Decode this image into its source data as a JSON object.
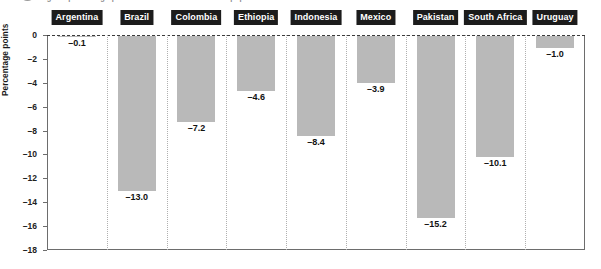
{
  "caption": {
    "bullet_icon": "bullet-dot-icon",
    "text": "Figure: percentage-point decline in the share of the population..."
  },
  "chart_data": {
    "type": "bar",
    "title": "",
    "xlabel": "",
    "ylabel": "Percentage points",
    "ylim": [
      -18,
      0
    ],
    "yticks": [
      0,
      -2,
      -4,
      -6,
      -8,
      -10,
      -12,
      -14,
      -16,
      -18
    ],
    "ytick_labels": [
      "0",
      "–2",
      "–4",
      "–6",
      "–8",
      "–10",
      "–12",
      "–14",
      "–16",
      "–18"
    ],
    "grid": "dotted-vertical-category-separators",
    "legend": "none",
    "categories": [
      "Argentina",
      "Brazil",
      "Colombia",
      "Ethiopia",
      "Indonesia",
      "Mexico",
      "Pakistan",
      "South Africa",
      "Uruguay"
    ],
    "values": [
      -0.1,
      -13.0,
      -7.2,
      -4.6,
      -8.4,
      -3.9,
      -15.2,
      -10.1,
      -1.0
    ],
    "data_labels": [
      "–0.1",
      "–13.0",
      "–7.2",
      "–4.6",
      "–8.4",
      "–3.9",
      "–15.2",
      "–10.1",
      "–1.0"
    ],
    "bar_color": "#b9b9b9",
    "label_tag_bg": "#1c1c1c",
    "label_tag_fg": "#ffffff",
    "axis_color": "#6d6d6d"
  }
}
